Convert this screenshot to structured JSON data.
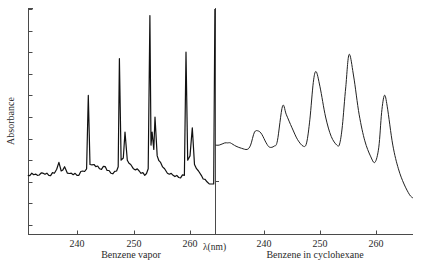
{
  "chart_data": [
    {
      "panel": "left",
      "type": "line",
      "title": "",
      "xlabel": "Benzene vapor",
      "ylabel": "Absorbance",
      "x_unit_label": "λ(nm)",
      "xlim": [
        231.3,
        264.4
      ],
      "ylim": [
        0,
        10
      ],
      "x_ticks": [
        240,
        250,
        260
      ],
      "y_ticks": [
        0,
        1,
        2,
        3,
        4,
        5,
        6,
        7,
        8,
        9,
        10
      ],
      "y_tick_labels_shown": false,
      "grid": false,
      "line_color": "#111111",
      "line_style": "noisy, sharp vibronic lines",
      "peaks": [
        {
          "x": 236.8,
          "y": 2.9
        },
        {
          "x": 237.8,
          "y": 2.7
        },
        {
          "x": 242.0,
          "y": 6.0
        },
        {
          "x": 243.0,
          "y": 2.8
        },
        {
          "x": 247.5,
          "y": 7.7
        },
        {
          "x": 248.5,
          "y": 4.3
        },
        {
          "x": 252.9,
          "y": 9.7
        },
        {
          "x": 253.3,
          "y": 4.3
        },
        {
          "x": 253.8,
          "y": 5.0
        },
        {
          "x": 259.3,
          "y": 8.0
        },
        {
          "x": 260.4,
          "y": 4.5
        },
        {
          "x": 264.4,
          "y": 10.0
        }
      ],
      "baseline": 2.2,
      "series": [
        {
          "name": "Benzene vapor",
          "x": [
            231.3,
            232,
            233,
            234,
            235,
            236,
            236.8,
            237.2,
            237.8,
            238.3,
            239,
            240,
            241,
            241.7,
            242.0,
            242.3,
            243,
            244,
            245,
            246,
            247,
            247.3,
            247.5,
            247.8,
            248.2,
            248.5,
            248.9,
            249.5,
            250,
            251,
            252,
            252.6,
            252.9,
            253.1,
            253.3,
            253.6,
            253.8,
            254.2,
            254.8,
            255.5,
            256,
            257,
            258,
            259,
            259.3,
            259.6,
            260,
            260.4,
            260.8,
            261.5,
            262,
            263,
            263.8,
            264.2,
            264.4
          ],
          "y": [
            2.3,
            2.4,
            2.3,
            2.4,
            2.3,
            2.4,
            2.9,
            2.5,
            2.7,
            2.4,
            2.4,
            2.3,
            2.5,
            2.6,
            6.0,
            2.8,
            2.8,
            2.6,
            2.7,
            2.4,
            2.5,
            2.7,
            7.7,
            3.0,
            3.1,
            4.3,
            3.0,
            2.8,
            2.6,
            2.5,
            2.3,
            2.6,
            9.7,
            3.7,
            4.3,
            3.5,
            5.0,
            3.2,
            2.9,
            2.6,
            2.4,
            2.3,
            2.2,
            2.3,
            8.0,
            3.0,
            3.2,
            4.5,
            2.8,
            2.5,
            2.3,
            2.0,
            1.9,
            1.9,
            10.0
          ]
        }
      ]
    },
    {
      "panel": "right",
      "type": "line",
      "title": "",
      "xlabel": "Benzene in cyclohexane",
      "ylabel": "",
      "xlim": [
        231.3,
        266.6
      ],
      "ylim": [
        0,
        10
      ],
      "x_ticks": [
        240,
        250,
        260
      ],
      "grid": false,
      "line_color": "#222222",
      "line_style": "smooth band envelope",
      "peaks": [
        {
          "x": 233.5,
          "y": 3.7
        },
        {
          "x": 238.5,
          "y": 4.3
        },
        {
          "x": 243.3,
          "y": 5.5
        },
        {
          "x": 249.3,
          "y": 7.1
        },
        {
          "x": 255.2,
          "y": 7.9
        },
        {
          "x": 261.5,
          "y": 6.0
        }
      ],
      "series": [
        {
          "name": "Benzene in cyclohexane",
          "x": [
            231.3,
            232,
            233,
            233.5,
            234,
            235,
            236,
            237,
            237.6,
            238.3,
            239,
            239.6,
            240.4,
            241,
            241.8,
            242.4,
            243.3,
            244,
            245,
            246,
            247,
            247.6,
            248.2,
            248.8,
            249.3,
            250,
            251,
            252,
            253,
            253.5,
            254,
            254.6,
            255.2,
            256,
            257,
            258,
            259,
            259.8,
            260.5,
            261,
            261.5,
            262,
            263,
            264,
            265,
            266,
            266.6
          ],
          "y": [
            3.7,
            3.7,
            3.8,
            3.8,
            3.8,
            3.65,
            3.55,
            3.5,
            3.7,
            4.3,
            4.35,
            4.2,
            3.8,
            3.6,
            3.65,
            3.9,
            5.5,
            5.1,
            4.5,
            3.95,
            3.65,
            3.8,
            4.9,
            6.6,
            7.1,
            6.4,
            5.0,
            4.1,
            3.7,
            3.75,
            4.6,
            6.4,
            7.9,
            6.9,
            5.1,
            3.9,
            3.2,
            2.9,
            3.6,
            5.2,
            6.0,
            5.5,
            3.7,
            2.6,
            1.9,
            1.4,
            1.25
          ]
        }
      ]
    }
  ],
  "labels": {
    "ylabel": "Absorbance",
    "left_xlabel": "Benzene vapor",
    "right_xlabel": "Benzene in cyclohexane",
    "unit": "λ(nm)",
    "left_ticks": [
      "240",
      "250",
      "260"
    ],
    "right_ticks": [
      "240",
      "250",
      "260"
    ]
  },
  "colors": {
    "axis": "#4a4a4a",
    "vapor_line": "#111111",
    "solution_line": "#222222",
    "background": "#ffffff"
  }
}
